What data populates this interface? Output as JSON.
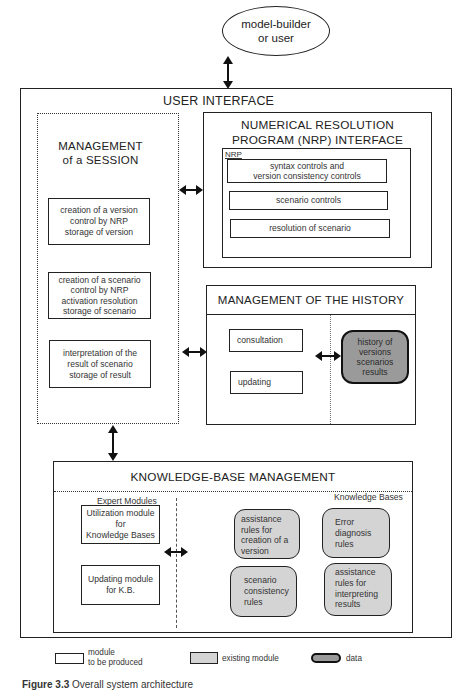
{
  "actor": {
    "label_line1": "model-builder",
    "label_line2": "or user"
  },
  "user_interface": {
    "title": "USER INTERFACE"
  },
  "session": {
    "title_line1": "MANAGEMENT",
    "title_line2": "of a SESSION",
    "modules": [
      {
        "lines": [
          "creation of a version",
          "control by NRP",
          "storage of version"
        ]
      },
      {
        "lines": [
          "creation of a scenario",
          "control by NRP",
          "activation resolution",
          "storage of scenario"
        ]
      },
      {
        "lines": [
          "interpretation of the",
          "result of scenario",
          "storage of result"
        ]
      }
    ]
  },
  "nrp_interface": {
    "title_line1": "NUMERICAL RESOLUTION",
    "title_line2": "PROGRAM (NRP) INTERFACE",
    "inner_label": "NRP",
    "modules": [
      {
        "lines": [
          "syntax controls and",
          "version consistency controls"
        ]
      },
      {
        "lines": [
          "scenario controls"
        ]
      },
      {
        "lines": [
          "resolution of scenario"
        ]
      }
    ]
  },
  "history": {
    "title": "MANAGEMENT OF THE HISTORY",
    "modules": [
      {
        "label": "consultation"
      },
      {
        "label": "updating"
      }
    ],
    "data_store": {
      "lines": [
        "history of",
        "versions",
        "scenarios",
        "results"
      ]
    }
  },
  "knowledge_base": {
    "title": "KNOWLEDGE-BASE MANAGEMENT",
    "expert_modules_label": "Expert Modules",
    "knowledge_bases_label": "Knowledge Bases",
    "expert_modules": [
      {
        "lines": [
          "Utilization module",
          "for",
          "Knowledge Bases"
        ]
      },
      {
        "lines": [
          "Updating module",
          "for K.B."
        ]
      }
    ],
    "knowledge_bases": [
      {
        "lines": [
          "assistance",
          "rules for",
          "creation of a",
          "version"
        ]
      },
      {
        "lines": [
          "Error",
          "diagnosis",
          "rules"
        ]
      },
      {
        "lines": [
          "scenario",
          "consistency",
          "rules"
        ]
      },
      {
        "lines": [
          "assistance",
          "rules for",
          "interpreting",
          "results"
        ]
      }
    ]
  },
  "legend": {
    "items": [
      {
        "kind": "module-to-be-produced",
        "line1": "module",
        "line2": "to be produced"
      },
      {
        "kind": "existing-module",
        "line1": "existing module"
      },
      {
        "kind": "data",
        "line1": "data"
      }
    ]
  },
  "caption": {
    "figure": "Figure 3.3",
    "text": "Overall system architecture"
  },
  "colors": {
    "line": "#222222",
    "existing_module_fill": "#d4d4d4",
    "data_fill": "#9a9a9a"
  }
}
